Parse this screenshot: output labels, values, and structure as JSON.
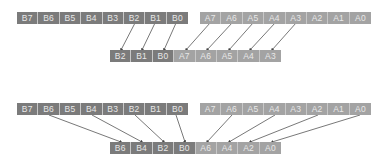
{
  "colors": {
    "b_cell": "#7b7b7b",
    "a_cell": "#a3a3a3",
    "cell_text": "#e8e8e8",
    "arrow": "#444444"
  },
  "top_section": {
    "source_b": [
      "B7",
      "B6",
      "B5",
      "B4",
      "B3",
      "B2",
      "B1",
      "B0"
    ],
    "source_a": [
      "A7",
      "A6",
      "A5",
      "A4",
      "A3",
      "A2",
      "A1",
      "A0"
    ],
    "result": [
      {
        "label": "B2",
        "kind": "b"
      },
      {
        "label": "B1",
        "kind": "b"
      },
      {
        "label": "B0",
        "kind": "b"
      },
      {
        "label": "A7",
        "kind": "a"
      },
      {
        "label": "A6",
        "kind": "a"
      },
      {
        "label": "A5",
        "kind": "a"
      },
      {
        "label": "A4",
        "kind": "a"
      },
      {
        "label": "A3",
        "kind": "a"
      }
    ],
    "mappings": [
      {
        "from": "B2",
        "to": "B2"
      },
      {
        "from": "B1",
        "to": "B1"
      },
      {
        "from": "B0",
        "to": "B0"
      },
      {
        "from": "A7",
        "to": "A7"
      },
      {
        "from": "A6",
        "to": "A6"
      },
      {
        "from": "A5",
        "to": "A5"
      },
      {
        "from": "A4",
        "to": "A4"
      },
      {
        "from": "A3",
        "to": "A3"
      }
    ]
  },
  "bottom_section": {
    "source_b": [
      "B7",
      "B6",
      "B5",
      "B4",
      "B3",
      "B2",
      "B1",
      "B0"
    ],
    "source_a": [
      "A7",
      "A6",
      "A5",
      "A4",
      "A3",
      "A2",
      "A1",
      "A0"
    ],
    "result": [
      {
        "label": "B6",
        "kind": "b"
      },
      {
        "label": "B4",
        "kind": "b"
      },
      {
        "label": "B2",
        "kind": "b"
      },
      {
        "label": "B0",
        "kind": "b"
      },
      {
        "label": "A6",
        "kind": "a"
      },
      {
        "label": "A4",
        "kind": "a"
      },
      {
        "label": "A2",
        "kind": "a"
      },
      {
        "label": "A0",
        "kind": "a"
      }
    ],
    "mappings": [
      {
        "from": "B6",
        "to": "B6"
      },
      {
        "from": "B4",
        "to": "B4"
      },
      {
        "from": "B2",
        "to": "B2"
      },
      {
        "from": "B0",
        "to": "B0"
      },
      {
        "from": "A6",
        "to": "A6"
      },
      {
        "from": "A4",
        "to": "A4"
      },
      {
        "from": "A2",
        "to": "A2"
      },
      {
        "from": "A0",
        "to": "A0"
      }
    ]
  }
}
